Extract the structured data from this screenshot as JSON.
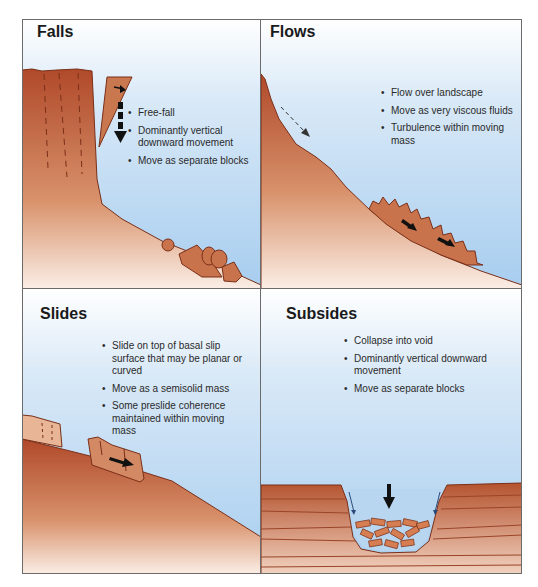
{
  "figure": {
    "panels": [
      {
        "id": "falls",
        "title": "Falls",
        "bullets": [
          "Free-fall",
          "Dominantly vertical downward movement",
          "Move as separate blocks"
        ]
      },
      {
        "id": "flows",
        "title": "Flows",
        "bullets": [
          "Flow over landscape",
          "Move as very viscous fluids",
          "Turbulence within moving mass"
        ]
      },
      {
        "id": "slides",
        "title": "Slides",
        "bullets": [
          "Slide on top of basal slip surface that may be planar or curved",
          "Move as a semisolid mass",
          "Some preslide coherence maintained within moving mass"
        ]
      },
      {
        "id": "subsides",
        "title": "Subsides",
        "bullets": [
          "Collapse into void",
          "Dominantly vertical downward movement",
          "Move as separate blocks"
        ]
      }
    ],
    "colors": {
      "rock_dark": "#b4532f",
      "rock_light": "#e8b596",
      "sky_top": "#ffffff",
      "sky_bottom": "#a7cdef",
      "border": "#6b6b6b",
      "arrow": "#111111"
    }
  }
}
